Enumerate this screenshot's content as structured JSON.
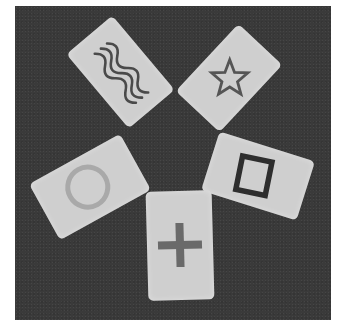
{
  "scene": {
    "description": "Five Zener ESP cards arranged in a star pattern on a dark textured surface",
    "background_color": "#3a3a3a",
    "card_color": "#cfcfcf",
    "cards": [
      {
        "symbol": "wavy-lines",
        "symbol_color": "#4a4a4a"
      },
      {
        "symbol": "star",
        "symbol_color": "#555555"
      },
      {
        "symbol": "circle",
        "symbol_color": "#a9a9a9"
      },
      {
        "symbol": "square",
        "symbol_color": "#2e2e2e"
      },
      {
        "symbol": "plus",
        "symbol_color": "#6a6a6a"
      }
    ]
  }
}
